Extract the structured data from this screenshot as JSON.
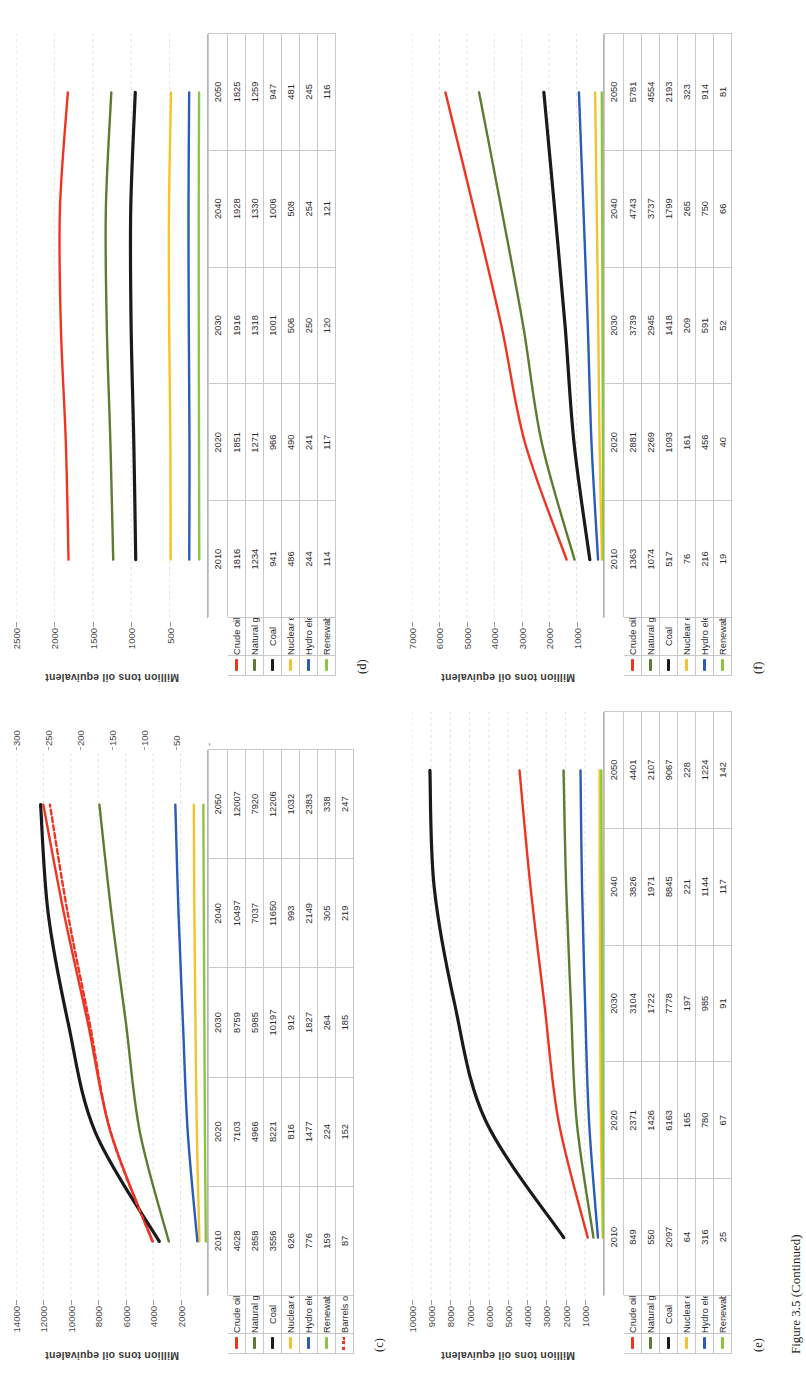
{
  "figure": {
    "caption": "Figure 3.5  (Continued)",
    "axis_title": "Million tons oil equivalent",
    "series_colors": {
      "crude_oil": "#ee3524",
      "natural_gas": "#5d7c32",
      "coal": "#1a1a1a",
      "nuclear_energy": "#f5c42a",
      "hydro_electricity": "#2a5cb8",
      "renewables": "#8cc63e",
      "barrels_of_oil": "#ee3524"
    },
    "series_labels": {
      "crude_oil": "Crude oil",
      "natural_gas": "Natural gas",
      "coal": "Coal",
      "nuclear_energy": "Nuclear energy",
      "hydro_electricity": "Hydro electricity",
      "renewables": "Renewables",
      "barrels_of_oil": "Barrels of oil"
    },
    "blank_tick": "-"
  },
  "panels": {
    "c": {
      "letter": "(c)",
      "chart_data": {
        "type": "line",
        "title": "",
        "xlabel": "",
        "ylabel": "Million tons oil equivalent",
        "categories": [
          "2010",
          "2020",
          "2030",
          "2040",
          "2050"
        ],
        "x": [
          2010,
          2020,
          2030,
          2040,
          2050
        ],
        "ylim": [
          0,
          14000
        ],
        "yticks": [
          2000,
          4000,
          6000,
          8000,
          10000,
          12000,
          14000
        ],
        "ytick_labels": [
          "2000",
          "4000",
          "6000",
          "8000",
          "10000",
          "12000",
          "14000"
        ],
        "y2lim": [
          0,
          300
        ],
        "y2ticks": [
          50,
          100,
          150,
          200,
          250,
          300
        ],
        "y2tick_labels": [
          "50",
          "100",
          "150",
          "200",
          "250",
          "300"
        ],
        "grid": true,
        "legend_position": "below-left",
        "series": [
          {
            "name": "Crude oil",
            "color": "#ee3524",
            "style": "solid",
            "axis": "left",
            "values": [
              4028,
              7103,
              8759,
              10497,
              12007
            ]
          },
          {
            "name": "Natural gas",
            "color": "#5d7c32",
            "style": "solid",
            "axis": "left",
            "values": [
              2858,
              4966,
              5985,
              7037,
              7920
            ]
          },
          {
            "name": "Coal",
            "color": "#1a1a1a",
            "style": "solid",
            "axis": "left",
            "values": [
              3556,
              8221,
              10197,
              11650,
              12206
            ]
          },
          {
            "name": "Nuclear energy",
            "color": "#f5c42a",
            "style": "solid",
            "axis": "left",
            "values": [
              626,
              816,
              912,
              993,
              1032
            ]
          },
          {
            "name": "Hydro electricity",
            "color": "#2a5cb8",
            "style": "solid",
            "axis": "left",
            "values": [
              776,
              1477,
              1827,
              2149,
              2383
            ]
          },
          {
            "name": "Renewables",
            "color": "#8cc63e",
            "style": "solid",
            "axis": "left",
            "values": [
              159,
              224,
              264,
              305,
              338
            ]
          },
          {
            "name": "Barrels of oil",
            "color": "#ee3524",
            "style": "dashed",
            "axis": "right",
            "values": [
              87,
              152,
              185,
              219,
              247
            ]
          }
        ]
      }
    },
    "d": {
      "letter": "(d)",
      "chart_data": {
        "type": "line",
        "title": "",
        "xlabel": "",
        "ylabel": "Million tons oil equivalent",
        "categories": [
          "2010",
          "2020",
          "2030",
          "2040",
          "2050"
        ],
        "x": [
          2010,
          2020,
          2030,
          2040,
          2050
        ],
        "ylim": [
          0,
          2500
        ],
        "yticks": [
          500,
          1000,
          1500,
          2000,
          2500
        ],
        "ytick_labels": [
          "500",
          "1000",
          "1500",
          "2000",
          "2500"
        ],
        "grid": true,
        "legend_position": "below-left",
        "series": [
          {
            "name": "Crude oil",
            "color": "#ee3524",
            "style": "solid",
            "axis": "left",
            "values": [
              1816,
              1851,
              1916,
              1928,
              1825
            ]
          },
          {
            "name": "Natural gas",
            "color": "#5d7c32",
            "style": "solid",
            "axis": "left",
            "values": [
              1234,
              1271,
              1318,
              1330,
              1259
            ]
          },
          {
            "name": "Coal",
            "color": "#1a1a1a",
            "style": "solid",
            "axis": "left",
            "values": [
              941,
              966,
              1001,
              1006,
              947
            ]
          },
          {
            "name": "Nuclear energy",
            "color": "#f5c42a",
            "style": "solid",
            "axis": "left",
            "values": [
              486,
              490,
              506,
              508,
              481
            ]
          },
          {
            "name": "Hydro electricity",
            "color": "#2a5cb8",
            "style": "solid",
            "axis": "left",
            "values": [
              244,
              241,
              250,
              254,
              245
            ]
          },
          {
            "name": "Renewables",
            "color": "#8cc63e",
            "style": "solid",
            "axis": "left",
            "values": [
              114,
              117,
              120,
              121,
              116
            ]
          }
        ]
      }
    },
    "e": {
      "letter": "(e)",
      "chart_data": {
        "type": "line",
        "title": "",
        "xlabel": "",
        "ylabel": "Million tons oil equivalent",
        "categories": [
          "2010",
          "2020",
          "2030",
          "2040",
          "2050"
        ],
        "x": [
          2010,
          2020,
          2030,
          2040,
          2050
        ],
        "ylim": [
          0,
          10000
        ],
        "yticks": [
          1000,
          2000,
          3000,
          4000,
          5000,
          6000,
          7000,
          8000,
          9000,
          10000
        ],
        "ytick_labels": [
          "1000",
          "2000",
          "3000",
          "4000",
          "5000",
          "6000",
          "7000",
          "8000",
          "9000",
          "10000"
        ],
        "grid": true,
        "legend_position": "below-left",
        "series": [
          {
            "name": "Crude oil",
            "color": "#ee3524",
            "style": "solid",
            "axis": "left",
            "values": [
              849,
              2371,
              3104,
              3826,
              4401
            ]
          },
          {
            "name": "Natural gas",
            "color": "#5d7c32",
            "style": "solid",
            "axis": "left",
            "values": [
              550,
              1426,
              1722,
              1971,
              2107
            ]
          },
          {
            "name": "Coal",
            "color": "#1a1a1a",
            "style": "solid",
            "axis": "left",
            "values": [
              2097,
              6163,
              7778,
              8845,
              9067
            ]
          },
          {
            "name": "Nuclear energy",
            "color": "#f5c42a",
            "style": "solid",
            "axis": "left",
            "values": [
              64,
              165,
              197,
              221,
              228
            ]
          },
          {
            "name": "Hydro electricity",
            "color": "#2a5cb8",
            "style": "solid",
            "axis": "left",
            "values": [
              316,
              780,
              985,
              1144,
              1224
            ]
          },
          {
            "name": "Renewables",
            "color": "#8cc63e",
            "style": "solid",
            "axis": "left",
            "values": [
              25,
              67,
              91,
              117,
              142
            ]
          }
        ]
      }
    },
    "f": {
      "letter": "(f)",
      "chart_data": {
        "type": "line",
        "title": "",
        "xlabel": "",
        "ylabel": "Million tons oil equivalent",
        "categories": [
          "2010",
          "2020",
          "2030",
          "2040",
          "2050"
        ],
        "x": [
          2010,
          2020,
          2030,
          2040,
          2050
        ],
        "ylim": [
          0,
          7000
        ],
        "yticks": [
          1000,
          2000,
          3000,
          4000,
          5000,
          6000,
          7000
        ],
        "ytick_labels": [
          "1000",
          "2000",
          "3000",
          "4000",
          "5000",
          "6000",
          "7000"
        ],
        "grid": true,
        "legend_position": "below-left",
        "series": [
          {
            "name": "Crude oil",
            "color": "#ee3524",
            "style": "solid",
            "axis": "left",
            "values": [
              1363,
              2881,
              3739,
              4743,
              5781
            ]
          },
          {
            "name": "Natural gas",
            "color": "#5d7c32",
            "style": "solid",
            "axis": "left",
            "values": [
              1074,
              2269,
              2945,
              3737,
              4554
            ]
          },
          {
            "name": "Coal",
            "color": "#1a1a1a",
            "style": "solid",
            "axis": "left",
            "values": [
              517,
              1093,
              1418,
              1799,
              2193
            ]
          },
          {
            "name": "Nuclear energy",
            "color": "#f5c42a",
            "style": "solid",
            "axis": "left",
            "values": [
              76,
              161,
              209,
              265,
              323
            ]
          },
          {
            "name": "Hydro electricity",
            "color": "#2a5cb8",
            "style": "solid",
            "axis": "left",
            "values": [
              216,
              456,
              591,
              750,
              914
            ]
          },
          {
            "name": "Renewables",
            "color": "#8cc63e",
            "style": "solid",
            "axis": "left",
            "values": [
              19,
              40,
              52,
              66,
              81
            ]
          }
        ]
      }
    }
  }
}
